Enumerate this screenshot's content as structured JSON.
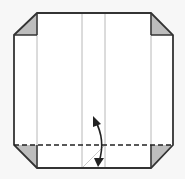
{
  "diagram": {
    "colors": {
      "background": "#f7f7f7",
      "paper": "#ffffff",
      "outline": "#333333",
      "crease": "#b8b8b8",
      "flap": "#bdbdbd",
      "arrow": "#222222"
    },
    "elements": [
      {
        "type": "paper-outline",
        "description": "Square sheet with four corners folded in"
      },
      {
        "type": "folded-corner",
        "position": "top-left"
      },
      {
        "type": "folded-corner",
        "position": "top-right"
      },
      {
        "type": "folded-corner",
        "position": "bottom-left"
      },
      {
        "type": "folded-corner",
        "position": "bottom-right"
      },
      {
        "type": "crease-line",
        "orientation": "vertical",
        "count": 4
      },
      {
        "type": "valley-fold-line",
        "style": "dashed",
        "orientation": "horizontal",
        "position": "bottom"
      },
      {
        "type": "fold-and-unfold-arrow",
        "direction": "up-down"
      }
    ]
  }
}
